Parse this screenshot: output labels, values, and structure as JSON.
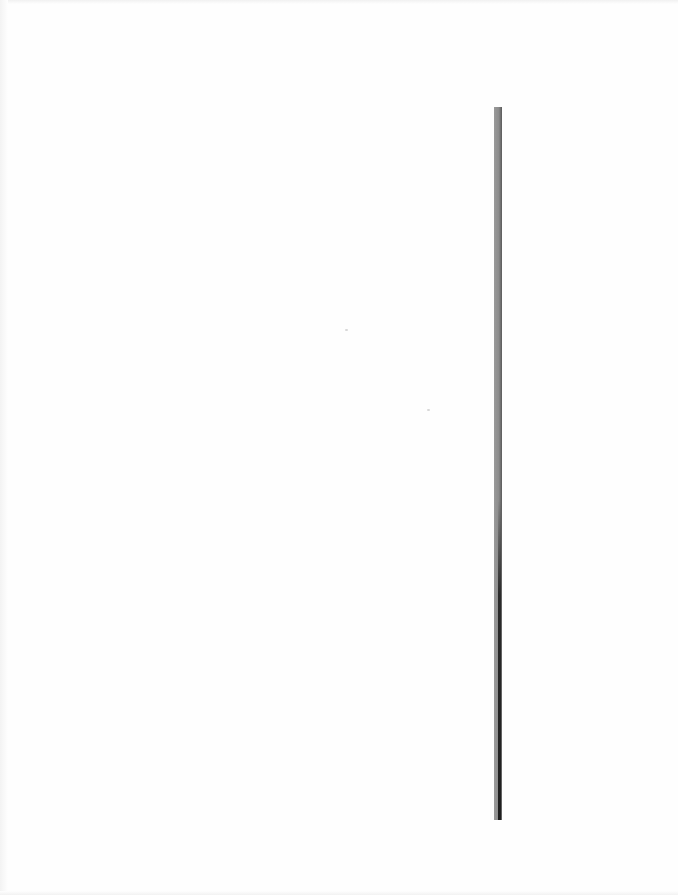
{
  "page": {
    "background_color": "#fefefe",
    "content": "blank scanned page"
  },
  "vertical_rule": {
    "color": "#8c8c8c",
    "dark_edge_color": "#1e1e1e",
    "x": 494,
    "top": 107,
    "bottom": 820,
    "width": 8
  },
  "specks": [
    {
      "x": 345,
      "y": 329
    },
    {
      "x": 427,
      "y": 409
    }
  ]
}
